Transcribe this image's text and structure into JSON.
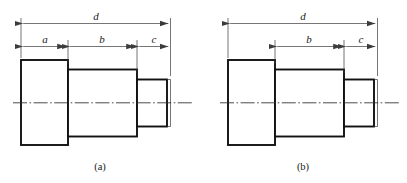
{
  "figure": {
    "background_color": "#ffffff",
    "line_color": "#111111",
    "thin_line_color": "#3b3b3b",
    "panels": [
      {
        "id": "panel-a",
        "caption": "(a)",
        "dimensions": [
          {
            "name": "overall",
            "label": "d"
          },
          {
            "name": "first-step",
            "label": "a"
          },
          {
            "name": "middle-step",
            "label": "b"
          },
          {
            "name": "last-step",
            "label": "c"
          }
        ]
      },
      {
        "id": "panel-b",
        "caption": "(b)",
        "dimensions": [
          {
            "name": "overall",
            "label": "d"
          },
          {
            "name": "middle-step",
            "label": "b"
          },
          {
            "name": "last-step",
            "label": "c"
          }
        ]
      }
    ]
  },
  "labels": {
    "a_overall": "d",
    "a_first": "a",
    "a_middle": "b",
    "a_last": "c",
    "a_caption": "(a)",
    "b_overall": "d",
    "b_middle": "b",
    "b_last": "c",
    "b_caption": "(b)"
  }
}
